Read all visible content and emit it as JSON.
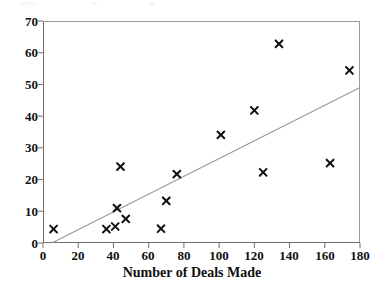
{
  "chart_data": {
    "type": "scatter",
    "title": "",
    "xlabel": "Number of Deals Made",
    "ylabel": "",
    "xlim": [
      0,
      180
    ],
    "ylim": [
      0,
      70
    ],
    "xticks": [
      0,
      20,
      40,
      60,
      80,
      100,
      120,
      140,
      160,
      180
    ],
    "yticks": [
      0,
      10,
      20,
      30,
      40,
      50,
      60,
      70
    ],
    "grid": false,
    "legend": null,
    "marker": "x",
    "marker_color": "#111111",
    "points": [
      {
        "x": 6,
        "y": 4.4
      },
      {
        "x": 36,
        "y": 4.4
      },
      {
        "x": 41,
        "y": 5.2
      },
      {
        "x": 42,
        "y": 11.0
      },
      {
        "x": 44,
        "y": 24.1
      },
      {
        "x": 47,
        "y": 7.6
      },
      {
        "x": 67,
        "y": 4.5
      },
      {
        "x": 70,
        "y": 13.3
      },
      {
        "x": 76,
        "y": 21.7
      },
      {
        "x": 101,
        "y": 34.1
      },
      {
        "x": 120,
        "y": 41.8
      },
      {
        "x": 125,
        "y": 22.3
      },
      {
        "x": 134,
        "y": 62.8
      },
      {
        "x": 163,
        "y": 25.2
      },
      {
        "x": 174,
        "y": 54.4
      }
    ],
    "trendline": {
      "type": "line",
      "color": "#999999",
      "x": [
        5,
        180
      ],
      "y": [
        0,
        49
      ]
    }
  },
  "axes": {
    "x_tick_labels": [
      "0",
      "20",
      "40",
      "60",
      "80",
      "100",
      "120",
      "140",
      "160",
      "180"
    ],
    "y_tick_labels": [
      "0",
      "10",
      "20",
      "30",
      "40",
      "50",
      "60",
      "70"
    ],
    "x_axis_title": "Number of Deals Made"
  }
}
